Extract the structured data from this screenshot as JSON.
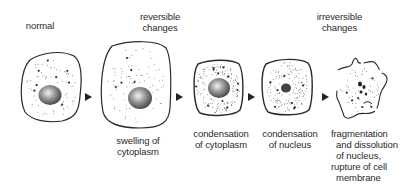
{
  "headers": {
    "normal": "normal",
    "reversible": "reversible\nchanges",
    "irreversible": "irreversible\nchanges"
  },
  "stages": [
    {
      "id": "normal",
      "caption": ""
    },
    {
      "id": "swelling",
      "caption": "swelling of\ncytoplasm"
    },
    {
      "id": "condensation-cytoplasm",
      "caption": "condensation\nof cytoplasm"
    },
    {
      "id": "condensation-nucleus",
      "caption": "condensation\nof nucleus"
    },
    {
      "id": "fragmentation",
      "caption": "fragmentation\n  and dissolution\n  of nucleus,\nrupture of cell\n  membrane"
    }
  ],
  "colors": {
    "outline": "#2a2a2a",
    "nucleus_light": "#e6e6e6",
    "nucleus_dark": "#4a4a4a",
    "arrow": "#222222"
  }
}
